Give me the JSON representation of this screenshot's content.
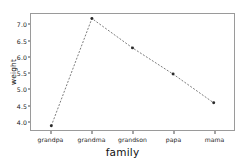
{
  "chart_data": {
    "type": "line",
    "title": "",
    "subtitle": "",
    "xlabel": "family",
    "ylabel": "weight",
    "categories": [
      "grandpa",
      "grandma",
      "grandson",
      "papa",
      "mama"
    ],
    "values": [
      3.85,
      7.21,
      6.29,
      5.47,
      4.57
    ],
    "series": [
      {
        "name": "weight",
        "values": [
          3.85,
          7.21,
          6.29,
          5.47,
          4.57
        ]
      }
    ],
    "ylim": [
      3.72,
      7.35
    ],
    "yticks": [
      4.0,
      4.5,
      5.0,
      5.5,
      6.0,
      6.5,
      7.0
    ],
    "ytick_labels": [
      "4.0",
      "4.5",
      "5.0",
      "5.5",
      "6.0",
      "6.5",
      "7.0"
    ],
    "xtick_labels": [
      "grandpa",
      "grandma",
      "grandson",
      "papa",
      "mama"
    ],
    "grid": false,
    "legend": null,
    "legend_position": "none",
    "line_style": "dashed",
    "marker": "circle",
    "colors": {
      "line": "#6b6b6b",
      "marker": "#2b2b2b",
      "frame": "#9a9a9a",
      "text": "#1a1a1a",
      "background": "#ffffff"
    }
  }
}
